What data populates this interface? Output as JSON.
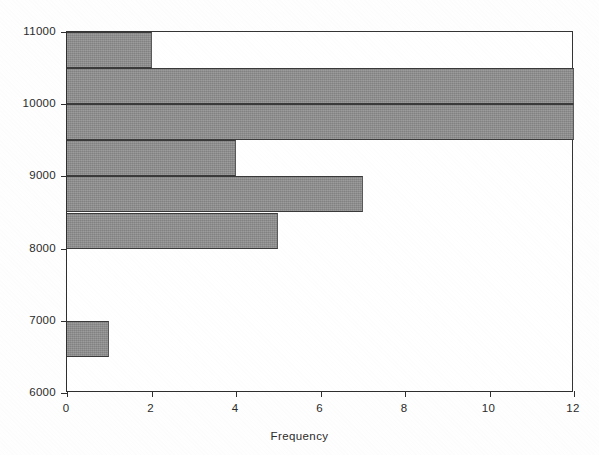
{
  "chart_data": {
    "type": "bar",
    "orientation": "horizontal",
    "title": "",
    "subtitle": "",
    "xlabel": "Frequency",
    "ylabel": "",
    "xlim": [
      0,
      12
    ],
    "ylim": [
      6000,
      11000
    ],
    "xticks": [
      "0",
      "2",
      "4",
      "6",
      "8",
      "10",
      "12"
    ],
    "xtick_values": [
      0,
      2,
      4,
      6,
      8,
      10,
      12
    ],
    "yticks": [
      "6000",
      "7000",
      "8000",
      "9000",
      "10000",
      "11000"
    ],
    "ytick_values": [
      6000,
      7000,
      8000,
      9000,
      10000,
      11000
    ],
    "grid": false,
    "legend": null,
    "bin_width": 500,
    "bar_color": "#8f8f8f",
    "bar_edge_color": "#3a3a3a",
    "axis_color": "#2e2e2e",
    "categories": [
      "6000-6500",
      "6500-7000",
      "7000-7500",
      "7500-8000",
      "8000-8500",
      "8500-9000",
      "9000-9500",
      "9500-10000",
      "10000-10500",
      "10500-11000"
    ],
    "bins": [
      {
        "low": 6000,
        "high": 6500,
        "frequency": 0
      },
      {
        "low": 6500,
        "high": 7000,
        "frequency": 1
      },
      {
        "low": 7000,
        "high": 7500,
        "frequency": 0
      },
      {
        "low": 7500,
        "high": 8000,
        "frequency": 0
      },
      {
        "low": 8000,
        "high": 8500,
        "frequency": 5
      },
      {
        "low": 8500,
        "high": 9000,
        "frequency": 7
      },
      {
        "low": 9000,
        "high": 9500,
        "frequency": 4
      },
      {
        "low": 9500,
        "high": 10000,
        "frequency": 12
      },
      {
        "low": 10000,
        "high": 10500,
        "frequency": 12
      },
      {
        "low": 10500,
        "high": 11000,
        "frequency": 2
      }
    ],
    "values": [
      0,
      1,
      0,
      0,
      5,
      7,
      4,
      12,
      12,
      2
    ]
  }
}
